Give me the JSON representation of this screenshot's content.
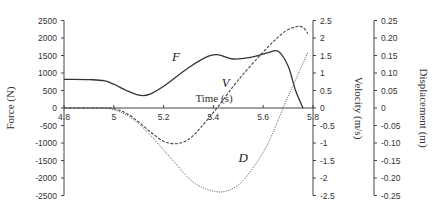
{
  "chart_data": {
    "type": "line",
    "title": "",
    "xlabel": "Time (s)",
    "xlim": [
      4.8,
      5.8
    ],
    "x_ticks": [
      "4.8",
      "5",
      "5.2",
      "5.4",
      "5.6",
      "5.8"
    ],
    "x_tick_values": [
      4.8,
      5.0,
      5.2,
      5.4,
      5.6,
      5.8
    ],
    "axes": [
      {
        "id": "force",
        "label": "Force (N)",
        "side": "left",
        "ylim": [
          -2500,
          2500
        ],
        "ticks": [
          "2500",
          "2000",
          "1500",
          "1000",
          "500",
          "0",
          "-500",
          "-1000",
          "-1500",
          "-2000",
          "-2500"
        ],
        "tick_values": [
          2500,
          2000,
          1500,
          1000,
          500,
          0,
          -500,
          -1000,
          -1500,
          -2000,
          -2500
        ]
      },
      {
        "id": "velocity",
        "label": "Velocity (m/s)",
        "side": "right",
        "ylim": [
          -2.5,
          2.5
        ],
        "ticks": [
          "2.5",
          "2",
          "1.5",
          "1",
          "0.5",
          "0",
          "-0.5",
          "-1",
          "-1.5",
          "-2",
          "-2.5"
        ],
        "tick_values": [
          2.5,
          2,
          1.5,
          1,
          0.5,
          0,
          -0.5,
          -1,
          -1.5,
          -2,
          -2.5
        ]
      },
      {
        "id": "displacement",
        "label": "Displacement (m)",
        "side": "far-right",
        "ylim": [
          -0.25,
          0.25
        ],
        "ticks": [
          "0.25",
          "0.20",
          "0.15",
          "0.10",
          "0.05",
          "0",
          "-0.05",
          "-0.10",
          "-0.15",
          "-0.20",
          "-0.25"
        ],
        "tick_values": [
          0.25,
          0.2,
          0.15,
          0.1,
          0.05,
          0,
          -0.05,
          -0.1,
          -0.15,
          -0.2,
          -0.25
        ]
      }
    ],
    "series": [
      {
        "name": "F",
        "axis": "force",
        "style": "solid",
        "x": [
          4.8,
          4.9,
          4.96,
          5.0,
          5.05,
          5.1,
          5.14,
          5.2,
          5.3,
          5.38,
          5.42,
          5.48,
          5.55,
          5.62,
          5.66,
          5.7,
          5.73,
          5.76
        ],
        "y": [
          820,
          810,
          780,
          680,
          500,
          370,
          380,
          620,
          1150,
          1480,
          1520,
          1400,
          1450,
          1580,
          1620,
          1200,
          500,
          0
        ]
      },
      {
        "name": "V",
        "axis": "velocity",
        "style": "dashed",
        "x": [
          4.8,
          4.95,
          5.0,
          5.05,
          5.1,
          5.15,
          5.2,
          5.25,
          5.3,
          5.35,
          5.42,
          5.5,
          5.6,
          5.68,
          5.73,
          5.76,
          5.78
        ],
        "y": [
          0,
          0,
          -0.02,
          -0.15,
          -0.4,
          -0.7,
          -0.95,
          -1.02,
          -0.9,
          -0.55,
          0.05,
          0.8,
          1.6,
          2.15,
          2.32,
          2.3,
          2.12
        ]
      },
      {
        "name": "D",
        "axis": "displacement",
        "style": "dotted",
        "x": [
          4.8,
          4.95,
          5.0,
          5.05,
          5.1,
          5.15,
          5.2,
          5.25,
          5.3,
          5.35,
          5.43,
          5.5,
          5.56,
          5.62,
          5.68,
          5.73,
          5.78
        ],
        "y": [
          0,
          0,
          -0.005,
          -0.02,
          -0.045,
          -0.08,
          -0.12,
          -0.16,
          -0.2,
          -0.225,
          -0.24,
          -0.22,
          -0.17,
          -0.1,
          0.0,
          0.08,
          0.16
        ]
      }
    ],
    "annotations": [
      {
        "text": "F",
        "x": 5.25,
        "y_force": 1350
      },
      {
        "text": "V",
        "x": 5.45,
        "y_force": 600
      },
      {
        "text": "D",
        "x": 5.52,
        "y_force": -1550
      }
    ],
    "grid": false,
    "legend": "none"
  }
}
